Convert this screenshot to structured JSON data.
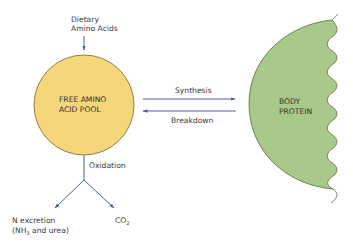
{
  "diagram": {
    "input": {
      "line1": "Dietary",
      "line2": "Amino Acids"
    },
    "pool": {
      "line1": "FREE AMINO",
      "line2": "ACID POOL",
      "color": "#F6D67A",
      "stroke": "#7a6630"
    },
    "protein": {
      "line1": "BODY",
      "line2": "PROTEIN",
      "color": "#A9C98A",
      "stroke": "#4f5d3e"
    },
    "flows": {
      "synthesis": "Synthesis",
      "breakdown": "Breakdown",
      "oxidation": "Oxidation"
    },
    "outputs": {
      "n_excretion_line1": "N excretion",
      "n_excretion_line2_prefix": "(NH",
      "n_excretion_line2_sub": "3",
      "n_excretion_line2_suffix": " and urea)",
      "co2_main": "CO",
      "co2_sub": "2"
    },
    "arrow_color": "#4a5fa8"
  }
}
